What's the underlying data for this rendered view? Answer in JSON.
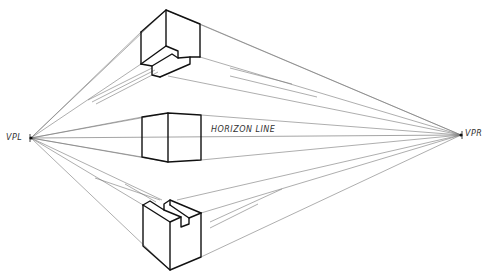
{
  "labels": {
    "vpl": "VPL",
    "vpr": "VPR",
    "horizon": "HORIZON LINE"
  },
  "vanishing_points": {
    "left": {
      "x": 31,
      "y": 138
    },
    "right": {
      "x": 461,
      "y": 135
    }
  },
  "boxes": [
    {
      "name": "above-horizon-notched-box",
      "position": "above horizon line"
    },
    {
      "name": "on-horizon-box",
      "position": "straddling horizon line"
    },
    {
      "name": "below-horizon-notched-box",
      "position": "below horizon line"
    }
  ],
  "colors": {
    "lines": "#111111",
    "guides": "#666666",
    "background": "#ffffff"
  }
}
